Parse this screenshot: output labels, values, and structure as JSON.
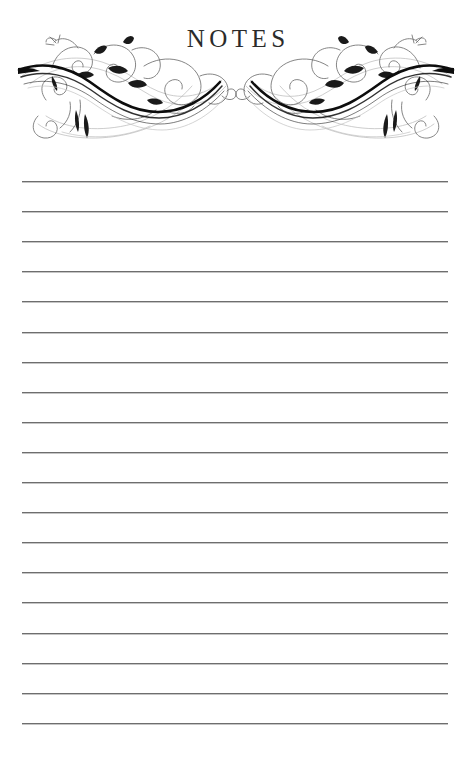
{
  "document": {
    "kind": "printable-note-paper",
    "title": "NOTES",
    "page_width": 472,
    "page_height": 760,
    "background_color": "#ffffff"
  },
  "header": {
    "title": "NOTES",
    "title_color": "#2b2b2b",
    "ornament_left_name": "floral-flourish-ornament-left",
    "ornament_right_name": "floral-flourish-ornament-right",
    "ornament_color_dark": "#111111",
    "ornament_color_light": "#9a9a9a"
  },
  "lines": {
    "count": 19,
    "first_y": 181,
    "spacing": 30.1,
    "left_x": 22,
    "right_x": 448,
    "color": "#6e6e6e",
    "thickness": 1
  }
}
